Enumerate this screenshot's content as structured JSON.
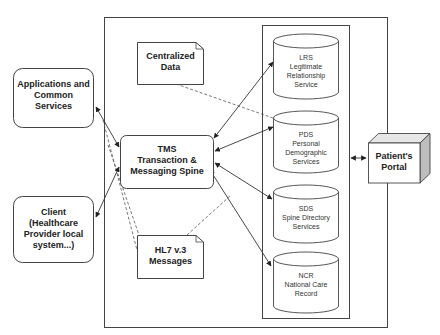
{
  "diagram": {
    "type": "architecture",
    "nodes": {
      "applications": {
        "label_lines": [
          "Applications and",
          "Common",
          "Services"
        ]
      },
      "client": {
        "label_lines": [
          "Client",
          "(Healthcare",
          "Provider local",
          "system...)"
        ]
      },
      "tms": {
        "label_lines": [
          "TMS",
          "Transaction &",
          "Messaging Spine"
        ]
      },
      "centralized_data": {
        "label_lines": [
          "Centralized",
          "Data"
        ]
      },
      "hl7": {
        "label_lines": [
          "HL7 v.3",
          "Messages"
        ]
      },
      "lrs": {
        "label_lines": [
          "LRS",
          "Legitimate",
          "Relationship",
          "Service"
        ]
      },
      "pds": {
        "label_lines": [
          "PDS",
          "Personal",
          "Demographic",
          "Services"
        ]
      },
      "sds": {
        "label_lines": [
          "SDS",
          "Spine Directory",
          "Services"
        ]
      },
      "ncr": {
        "label_lines": [
          "NCR",
          "National Care",
          "Record"
        ]
      },
      "portal": {
        "label_lines": [
          "Patient's",
          "Portal"
        ]
      }
    },
    "edges": [
      {
        "from": "applications",
        "to": "tms",
        "style": "solid",
        "arrows": "both"
      },
      {
        "from": "client",
        "to": "tms",
        "style": "solid",
        "arrows": "both"
      },
      {
        "from": "tms",
        "to": "lrs",
        "style": "solid",
        "arrows": "both"
      },
      {
        "from": "tms",
        "to": "pds",
        "style": "solid",
        "arrows": "both"
      },
      {
        "from": "tms",
        "to": "sds",
        "style": "solid",
        "arrows": "both"
      },
      {
        "from": "tms",
        "to": "ncr",
        "style": "solid",
        "arrows": "both"
      },
      {
        "from": "centralized_data",
        "to": "pds",
        "style": "dashed",
        "arrows": "none"
      },
      {
        "from": "hl7",
        "to": "sds",
        "style": "dashed",
        "arrows": "none"
      },
      {
        "from": "applications",
        "to": "hl7",
        "style": "dashed",
        "arrows": "none"
      },
      {
        "from": "client",
        "to": "hl7",
        "style": "dashed",
        "arrows": "none"
      },
      {
        "from": "data-services-group",
        "to": "portal",
        "style": "solid",
        "arrows": "both"
      }
    ],
    "colors": {
      "stroke": "#333333",
      "fill": "#ffffff",
      "portal_side": "#bdbdbd",
      "portal_top": "#e6e6e6"
    }
  }
}
